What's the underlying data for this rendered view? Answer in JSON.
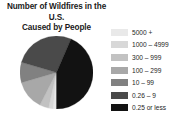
{
  "chart_data": {
    "type": "pie",
    "title": "Number of Wildfires in the U.S. Caused by People",
    "title_line1": "Number of Wildfires in the U.S.",
    "title_line2": "Caused by People",
    "xlabel": "",
    "ylabel": "",
    "grid": false,
    "legend_position": "right",
    "categories": [
      "5000 +",
      "1000 – 4999",
      "300 – 999",
      "100 – 299",
      "10 – 99",
      "0.26 – 9",
      "0.25 or less"
    ],
    "values": [
      1.5,
      2.0,
      4.0,
      13.0,
      9.0,
      27.0,
      43.5
    ],
    "colors": [
      "#e9e9e9",
      "#d8d8d8",
      "#c2c2c2",
      "#a8a8a8",
      "#818181",
      "#4a4a4a",
      "#121212"
    ],
    "slices": [
      {
        "label": "5000 +",
        "value": 1.5,
        "color": "#e9e9e9",
        "start_deg": 0,
        "end_deg": 5.4
      },
      {
        "label": "1000 – 4999",
        "value": 2.0,
        "color": "#d8d8d8",
        "start_deg": 5.4,
        "end_deg": 12.6
      },
      {
        "label": "300 – 999",
        "value": 4.0,
        "color": "#c2c2c2",
        "start_deg": 12.6,
        "end_deg": 27.0
      },
      {
        "label": "100 – 299",
        "value": 13.0,
        "color": "#a8a8a8",
        "start_deg": 27.0,
        "end_deg": 73.8
      },
      {
        "label": "10 – 99",
        "value": 9.0,
        "color": "#818181",
        "start_deg": 73.8,
        "end_deg": 106.2
      },
      {
        "label": "0.26 – 9",
        "value": 27.0,
        "color": "#4a4a4a",
        "start_deg": 106.2,
        "end_deg": 203.4
      },
      {
        "label": "0.25 or less",
        "value": 43.5,
        "color": "#121212",
        "start_deg": 203.4,
        "end_deg": 360.0
      }
    ],
    "geometry": {
      "cx": 36.5,
      "cy": 36.5,
      "r": 36.5,
      "rotation_deg": 180
    }
  },
  "legend": {
    "items": [
      {
        "label": "5000 +",
        "color": "#e9e9e9"
      },
      {
        "label": "1000 – 4999",
        "color": "#d8d8d8"
      },
      {
        "label": "300 – 999",
        "color": "#c2c2c2"
      },
      {
        "label": "100 – 299",
        "color": "#a8a8a8"
      },
      {
        "label": "10 – 99",
        "color": "#818181"
      },
      {
        "label": "0.26 – 9",
        "color": "#4a4a4a"
      },
      {
        "label": "0.25 or less",
        "color": "#121212"
      }
    ]
  }
}
